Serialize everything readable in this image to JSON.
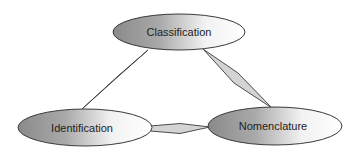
{
  "diagram": {
    "type": "triangle-relationship",
    "nodes": [
      {
        "id": "classification",
        "label": "Classification",
        "cx": 179,
        "cy": 32,
        "rx": 66,
        "ry": 18
      },
      {
        "id": "identification",
        "label": "Identification",
        "cx": 85,
        "cy": 127.5,
        "rx": 67,
        "ry": 18.5
      },
      {
        "id": "nomenclature",
        "label": "Nomenclature",
        "cx": 275,
        "cy": 126,
        "rx": 67,
        "ry": 19
      }
    ],
    "edges": [
      {
        "from": "classification",
        "to": "identification"
      },
      {
        "from": "classification",
        "to": "nomenclature"
      },
      {
        "from": "identification",
        "to": "nomenclature"
      }
    ],
    "colors": {
      "gradient_dark": "#8a8a8a",
      "gradient_light": "#ffffff",
      "stroke": "#3a3a3a",
      "connector_fill": "#d4d4d4",
      "text": "#222222"
    }
  }
}
